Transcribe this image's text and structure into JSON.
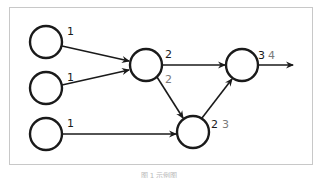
{
  "diagram": {
    "title": "",
    "colors": {
      "node_stroke": "#1a1a1a",
      "edge": "#1a1a1a",
      "label_primary": "#1a1a1a",
      "label_secondary": "#7a7a7a",
      "frame": "#c8c8c8"
    },
    "nodes": [
      {
        "id": "in1",
        "cx": 46,
        "cy": 42,
        "r": 16,
        "label_primary": "1",
        "label_secondary": ""
      },
      {
        "id": "in2",
        "cx": 46,
        "cy": 88,
        "r": 16,
        "label_primary": "1",
        "label_secondary": ""
      },
      {
        "id": "in3",
        "cx": 46,
        "cy": 134,
        "r": 16,
        "label_primary": "1",
        "label_secondary": ""
      },
      {
        "id": "mid",
        "cx": 146,
        "cy": 65,
        "r": 16,
        "label_primary": "2",
        "label_secondary": "2"
      },
      {
        "id": "out",
        "cx": 242,
        "cy": 65,
        "r": 16,
        "label_primary": "3",
        "label_secondary": "4"
      },
      {
        "id": "low",
        "cx": 193,
        "cy": 132,
        "r": 16,
        "label_primary": "2",
        "label_secondary": "3"
      }
    ],
    "edges": [
      {
        "from": "in1",
        "to": "mid"
      },
      {
        "from": "in2",
        "to": "mid"
      },
      {
        "from": "in3",
        "to": "low"
      },
      {
        "from": "mid",
        "to": "out"
      },
      {
        "from": "mid",
        "to": "low"
      },
      {
        "from": "low",
        "to": "out"
      },
      {
        "from": "out",
        "to": "exit"
      }
    ],
    "labels": {
      "in1": "1",
      "in2": "1",
      "in3": "1",
      "mid_top": "2",
      "mid_bottom": "2",
      "out_primary": "3",
      "out_secondary": "4",
      "low_primary": "2",
      "low_secondary": "3"
    },
    "caption": "图 1  示例图"
  }
}
